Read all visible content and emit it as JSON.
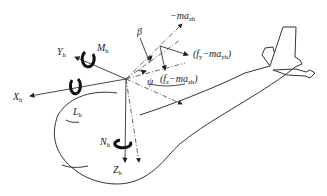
{
  "figure": {
    "type": "helicopter-body-axes-force-diagram",
    "labels": {
      "x_axis": {
        "main": "X",
        "sub": "h"
      },
      "y_axis": {
        "main": "Y",
        "sub": "h"
      },
      "z_axis": {
        "main": "Z",
        "sub": "h"
      },
      "roll_moment": {
        "main": "L",
        "sub": "h"
      },
      "pitch_moment": {
        "main": "M",
        "sub": "h"
      },
      "yaw_moment": {
        "main": "N",
        "sub": "h"
      },
      "beta": "β",
      "psi": "ψ",
      "top_force": {
        "main": "−ma",
        "sub": "zh"
      },
      "right_force": {
        "pre": "(f",
        "fsub": "y",
        "mid": "−ma",
        "sub": "yh",
        "post": ")"
      },
      "lower_force": {
        "pre": "(f",
        "fsub": "z",
        "mid": "−ma",
        "sub": "zh",
        "post": ")"
      }
    },
    "colors": {
      "line": "#333333",
      "background": "#ffffff"
    }
  }
}
